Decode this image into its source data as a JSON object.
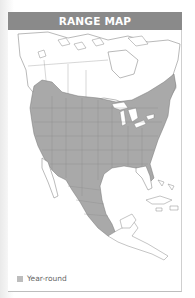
{
  "header": {
    "title": "RANGE MAP"
  },
  "map": {
    "region": "North America",
    "colors": {
      "range_fill": "#a9a9a9",
      "land_fill": "#ffffff",
      "border_stroke": "#7a7a7a",
      "header_bg": "#8a8a8a"
    }
  },
  "legend": {
    "items": [
      {
        "label": "Year-round",
        "color": "#bdbdbd"
      }
    ]
  }
}
